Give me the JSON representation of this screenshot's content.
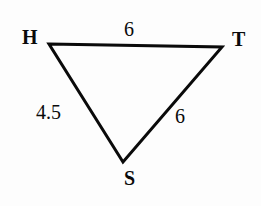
{
  "figure": {
    "kind": "triangle-diagram",
    "background_color": "#fdfdfd",
    "stroke_color": "#0a0a0a",
    "stroke_width": 3,
    "vertices": [
      {
        "name": "H",
        "label": "H",
        "x": 49,
        "y": 44
      },
      {
        "name": "T",
        "label": "T",
        "x": 222,
        "y": 47
      },
      {
        "name": "S",
        "label": "S",
        "x": 123,
        "y": 162
      }
    ],
    "sides": [
      {
        "name": "HT",
        "from": "H",
        "to": "T",
        "length_label": "6"
      },
      {
        "name": "HS",
        "from": "H",
        "to": "S",
        "length_label": "4.5"
      },
      {
        "name": "ST",
        "from": "S",
        "to": "T",
        "length_label": "6"
      }
    ]
  }
}
